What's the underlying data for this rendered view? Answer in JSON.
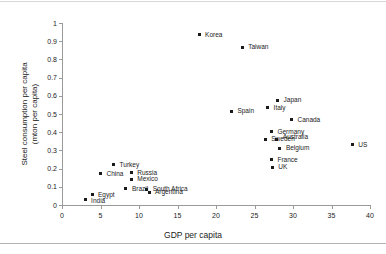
{
  "chart_data": {
    "type": "scatter",
    "title": "",
    "xlabel": "GDP per capita",
    "ylabel_line1": "Steel consumption per capita",
    "ylabel_line2": "(mton per capita)",
    "xlim": [
      0,
      40
    ],
    "ylim": [
      0,
      1
    ],
    "xticks": [
      0,
      5,
      10,
      15,
      20,
      25,
      30,
      35,
      40
    ],
    "xticklabels": [
      "0",
      "5",
      "10",
      "15",
      "20",
      "25",
      "30",
      "35",
      "40"
    ],
    "yticks": [
      0,
      0.1,
      0.2,
      0.3,
      0.4,
      0.5,
      0.6,
      0.7,
      0.8,
      0.9,
      1
    ],
    "yticklabels": [
      "0",
      "0.1",
      "0.2",
      "0.3",
      "0.4",
      "0.5",
      "0.6",
      "0.7",
      "0.8",
      "0.9",
      "1"
    ],
    "grid": false,
    "legend": "none",
    "marker_color": "#1a1a1a",
    "axis_color": "#9a9a9a",
    "points": [
      {
        "label": "India",
        "x": 3.0,
        "y": 0.03,
        "lx": 6,
        "ly": 4
      },
      {
        "label": "Egypt",
        "x": 3.9,
        "y": 0.055,
        "lx": 6,
        "ly": 3
      },
      {
        "label": "China",
        "x": 5.0,
        "y": 0.172,
        "lx": 6,
        "ly": 3
      },
      {
        "label": "Turkey",
        "x": 6.7,
        "y": 0.222,
        "lx": 6,
        "ly": 3
      },
      {
        "label": "Brazil",
        "x": 8.3,
        "y": 0.088,
        "lx": 6,
        "ly": 3
      },
      {
        "label": "Mexico",
        "x": 9.0,
        "y": 0.142,
        "lx": 6,
        "ly": 3
      },
      {
        "label": "Russia",
        "x": 9.0,
        "y": 0.178,
        "lx": 6,
        "ly": 3
      },
      {
        "label": "South Africa",
        "x": 11.0,
        "y": 0.085,
        "lx": 6,
        "ly": 2
      },
      {
        "label": "Argentina",
        "x": 11.3,
        "y": 0.07,
        "lx": 6,
        "ly": 3
      },
      {
        "label": "Korea",
        "x": 17.8,
        "y": 0.935,
        "lx": 6,
        "ly": 3
      },
      {
        "label": "Taiwan",
        "x": 23.4,
        "y": 0.868,
        "lx": 6,
        "ly": 3
      },
      {
        "label": "Spain",
        "x": 22.0,
        "y": 0.515,
        "lx": 6,
        "ly": 3
      },
      {
        "label": "Italy",
        "x": 26.7,
        "y": 0.533,
        "lx": 6,
        "ly": 3
      },
      {
        "label": "Japan",
        "x": 28.0,
        "y": 0.575,
        "lx": 6,
        "ly": 3
      },
      {
        "label": "Canada",
        "x": 29.8,
        "y": 0.468,
        "lx": 6,
        "ly": 3
      },
      {
        "label": "Germany",
        "x": 27.2,
        "y": 0.403,
        "lx": 6,
        "ly": 3
      },
      {
        "label": "Sweden",
        "x": 26.4,
        "y": 0.36,
        "lx": 6,
        "ly": 3
      },
      {
        "label": "Australia",
        "x": 27.9,
        "y": 0.36,
        "lx": 6,
        "ly": 1
      },
      {
        "label": "Belgium",
        "x": 28.3,
        "y": 0.313,
        "lx": 6,
        "ly": 3
      },
      {
        "label": "France",
        "x": 27.2,
        "y": 0.248,
        "lx": 6,
        "ly": 3
      },
      {
        "label": "UK",
        "x": 27.3,
        "y": 0.207,
        "lx": 6,
        "ly": 3
      },
      {
        "label": "US",
        "x": 37.7,
        "y": 0.33,
        "lx": 6,
        "ly": 3
      }
    ]
  }
}
